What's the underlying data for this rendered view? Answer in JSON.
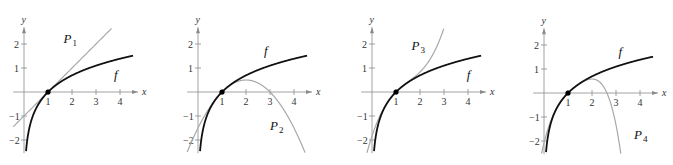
{
  "chart_data": [
    {
      "type": "line",
      "title": "",
      "xlabel": "x",
      "ylabel": "y",
      "xticks": [
        1,
        2,
        3,
        4
      ],
      "yticks": [
        -2,
        -1,
        1,
        2
      ],
      "xlim": [
        -0.5,
        4.8
      ],
      "ylim": [
        -2.6,
        2.7
      ],
      "grid": false,
      "point": {
        "x": 1,
        "y": 0
      },
      "series": [
        {
          "name": "f",
          "expr": "ln(x)",
          "color": "#111111",
          "label_pos": {
            "x": 3.75,
            "y": 0.55
          }
        },
        {
          "name": "P1",
          "label": "P",
          "sub": "1",
          "expr": "(x-1)",
          "color": "#a8a8a8",
          "label_pos": {
            "x": 1.65,
            "y": 2.05
          }
        }
      ]
    },
    {
      "type": "line",
      "xlabel": "x",
      "ylabel": "y",
      "xticks": [
        1,
        2,
        3,
        4
      ],
      "yticks": [
        -2,
        -1,
        1,
        2
      ],
      "xlim": [
        -0.5,
        4.8
      ],
      "ylim": [
        -2.6,
        2.7
      ],
      "grid": false,
      "point": {
        "x": 1,
        "y": 0
      },
      "series": [
        {
          "name": "f",
          "expr": "ln(x)",
          "color": "#111111",
          "label_pos": {
            "x": 2.75,
            "y": 1.55
          }
        },
        {
          "name": "P2",
          "label": "P",
          "sub": "2",
          "expr": "(x-1) - (x-1)^2/2",
          "color": "#a8a8a8",
          "label_pos": {
            "x": 3.0,
            "y": -1.6
          }
        }
      ]
    },
    {
      "type": "line",
      "xlabel": "x",
      "ylabel": "y",
      "xticks": [
        1,
        2,
        3,
        4
      ],
      "yticks": [
        -2,
        -1,
        1,
        2
      ],
      "xlim": [
        -0.5,
        4.8
      ],
      "ylim": [
        -2.6,
        2.7
      ],
      "grid": false,
      "point": {
        "x": 1,
        "y": 0
      },
      "series": [
        {
          "name": "f",
          "expr": "ln(x)",
          "color": "#111111",
          "label_pos": {
            "x": 3.95,
            "y": 0.55
          }
        },
        {
          "name": "P3",
          "label": "P",
          "sub": "3",
          "expr": "(x-1) - (x-1)^2/2 + (x-1)^3/3",
          "color": "#a8a8a8",
          "label_pos": {
            "x": 1.65,
            "y": 1.75
          }
        }
      ]
    },
    {
      "type": "line",
      "xlabel": "x",
      "ylabel": "y",
      "xticks": [
        1,
        2,
        3,
        4
      ],
      "yticks": [
        -2,
        -1,
        1,
        2
      ],
      "xlim": [
        -0.5,
        4.8
      ],
      "ylim": [
        -2.6,
        2.7
      ],
      "grid": false,
      "point": {
        "x": 1,
        "y": 0
      },
      "series": [
        {
          "name": "f",
          "expr": "ln(x)",
          "color": "#111111",
          "label_pos": {
            "x": 3.1,
            "y": 1.55
          }
        },
        {
          "name": "P4",
          "label": "P",
          "sub": "4",
          "expr": "(x-1) - (x-1)^2/2 + (x-1)^3/3 - (x-1)^4/4",
          "color": "#a8a8a8",
          "label_pos": {
            "x": 3.75,
            "y": -1.9
          }
        }
      ]
    }
  ],
  "panels": {
    "origins_px": [
      [
        24,
        92
      ],
      [
        198,
        92
      ],
      [
        372,
        92
      ],
      [
        544,
        93
      ]
    ],
    "unit_px": 24
  }
}
